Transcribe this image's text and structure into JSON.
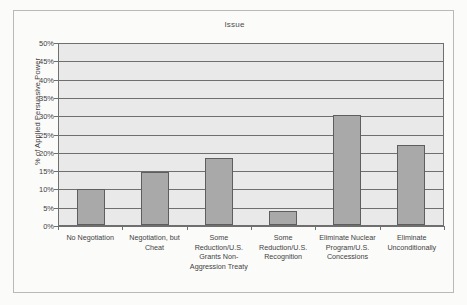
{
  "chart_data": {
    "type": "bar",
    "title": "Issue",
    "xlabel": "",
    "ylabel": "% of Applied Persuasive Power",
    "ylim": [
      0,
      50
    ],
    "ytick_labels": [
      "50%",
      "45%",
      "40%",
      "35%",
      "30%",
      "25%",
      "20%",
      "15%",
      "10%",
      "5%",
      "0%"
    ],
    "ytick_values": [
      50,
      45,
      40,
      35,
      30,
      25,
      20,
      15,
      10,
      5,
      0
    ],
    "grid": "horizontal",
    "legend": "none",
    "categories": [
      "No Negotiation",
      "Negotiation, but Cheat",
      "Some Reduction/U.S. Grants Non-Aggression Treaty",
      "Some Reduction/U.S. Recognition",
      "Eliminate Nuclear Program/U.S. Concessions",
      "Eliminate Unconditionally"
    ],
    "values": [
      10.0,
      14.6,
      18.4,
      3.8,
      30.4,
      22.2
    ],
    "colors": {
      "bar_fill": "#a9a9a9",
      "bar_border": "#5e5e5e",
      "plot_background": "#e9e9e9",
      "gridline": "#6f6f6f",
      "axis": "#6f6f6f",
      "text": "#3f3f3f",
      "page_background": "#fbfbfa",
      "frame_border": "#b9b9b9"
    }
  }
}
